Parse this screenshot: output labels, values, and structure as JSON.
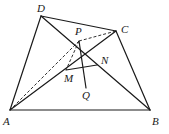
{
  "figure": {
    "type": "geometry-diagram",
    "points": {
      "A": {
        "label": "A",
        "x": 10,
        "y": 110,
        "lx": 3,
        "ly": 125
      },
      "B": {
        "label": "B",
        "x": 150,
        "y": 110,
        "lx": 152,
        "ly": 125
      },
      "C": {
        "label": "C",
        "x": 116,
        "y": 31,
        "lx": 121,
        "ly": 33
      },
      "D": {
        "label": "D",
        "x": 41,
        "y": 16,
        "lx": 37,
        "ly": 12
      },
      "P": {
        "label": "P",
        "x": 79,
        "y": 41,
        "lx": 75,
        "ly": 35
      },
      "M": {
        "label": "M",
        "x": 66,
        "y": 70,
        "lx": 64,
        "ly": 82
      },
      "N": {
        "label": "N",
        "x": 97,
        "y": 65,
        "lx": 101,
        "ly": 64
      },
      "Q": {
        "label": "Q",
        "x": 86,
        "y": 88,
        "lx": 82,
        "ly": 99
      }
    },
    "solid_segments": [
      [
        "A",
        "B"
      ],
      [
        "B",
        "C"
      ],
      [
        "C",
        "D"
      ],
      [
        "D",
        "A"
      ],
      [
        "A",
        "C"
      ],
      [
        "B",
        "D"
      ],
      [
        "P",
        "Q"
      ],
      [
        "M",
        "N"
      ]
    ],
    "dashed_segments": [
      [
        "P",
        "C"
      ],
      [
        "P",
        "A"
      ],
      [
        "P",
        "M"
      ]
    ]
  }
}
